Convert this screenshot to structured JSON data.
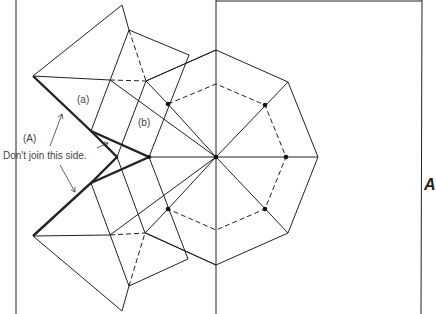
{
  "labels": {
    "a": "(a)",
    "b": "(b)",
    "A": "(A)",
    "note": "Don't join this side.",
    "edge_glyph": "A"
  },
  "colors": {
    "line": "#222222",
    "background": "#ffffff"
  },
  "diagram": {
    "octagon_center": [
      216,
      157
    ],
    "dots": [
      [
        168,
        104
      ],
      [
        265,
        105
      ],
      [
        286,
        157
      ],
      [
        265,
        209
      ],
      [
        168,
        209
      ],
      [
        216,
        157
      ],
      [
        149,
        157
      ]
    ]
  }
}
